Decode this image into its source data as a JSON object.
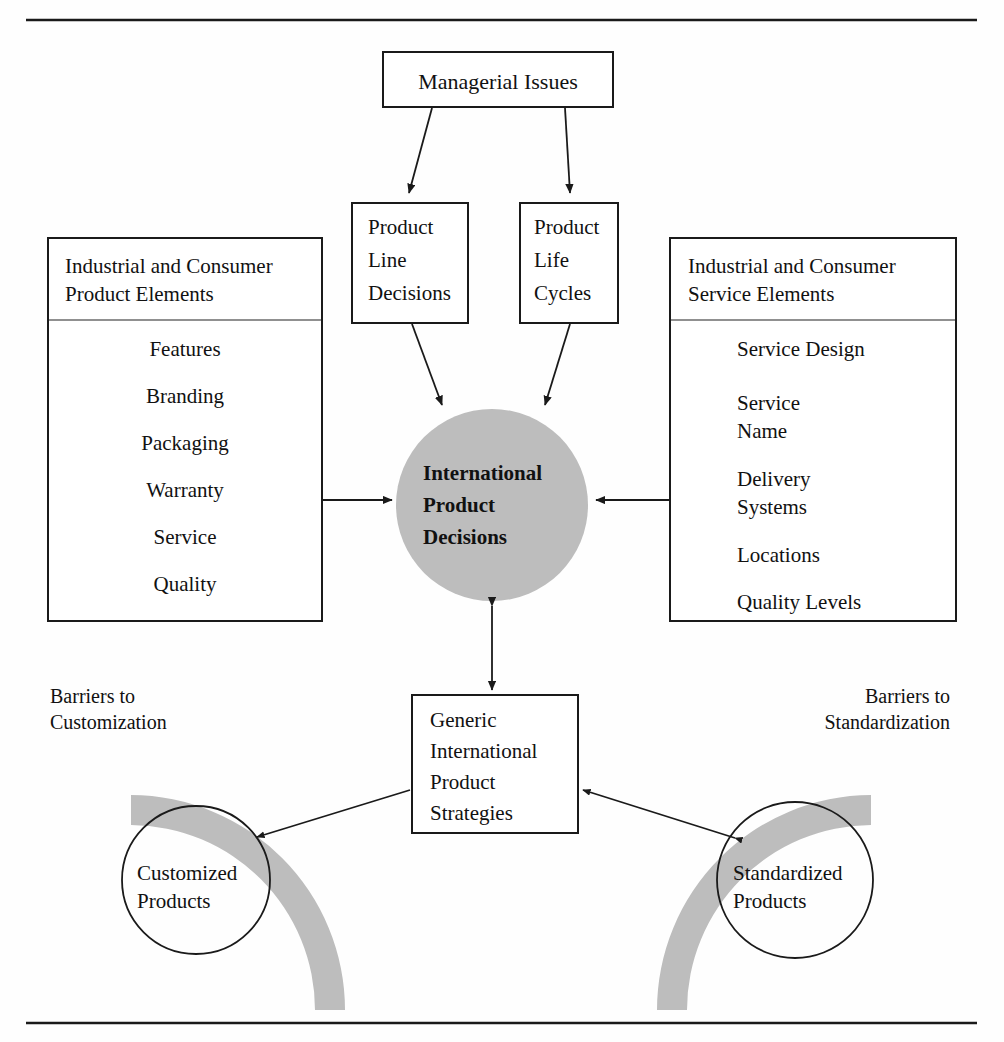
{
  "figure": {
    "type": "flow-diagram",
    "accent_gray": "#bdbdbd",
    "line_color": "#1a1a1a",
    "rules": [
      "top-rule",
      "bottom-rule"
    ]
  },
  "top_box": {
    "label": "Managerial Issues"
  },
  "mid_boxes": [
    {
      "id": "product-line-decisions",
      "lines": [
        "Product",
        "Line",
        "Decisions"
      ]
    },
    {
      "id": "product-life-cycles",
      "lines": [
        "Product",
        "Life",
        "Cycles"
      ]
    }
  ],
  "left_panel": {
    "header": [
      "Industrial and Consumer",
      "Product Elements"
    ],
    "items": [
      "Features",
      "Branding",
      "Packaging",
      "Warranty",
      "Service",
      "Quality"
    ]
  },
  "right_panel": {
    "header": [
      "Industrial and Consumer",
      "Service Elements"
    ],
    "items": [
      "Service Design",
      "Service\nName",
      "Delivery\nSystems",
      "Locations",
      "Quality Levels"
    ]
  },
  "hub": {
    "lines": [
      "International",
      "Product",
      "Decisions"
    ],
    "fill": "#bdbdbd"
  },
  "strategies_box": {
    "lines": [
      "Generic",
      "International",
      "Product",
      "Strategies"
    ]
  },
  "barriers": [
    {
      "id": "barriers-to-customization",
      "lines": [
        "Barriers to",
        "Customization"
      ]
    },
    {
      "id": "barriers-to-standardization",
      "lines": [
        "Barriers to",
        "Standardization"
      ]
    }
  ],
  "outcome_circles": [
    {
      "id": "customized-products",
      "lines": [
        "Customized",
        "Products"
      ]
    },
    {
      "id": "standardized-products",
      "lines": [
        "Standardized",
        "Products"
      ]
    }
  ]
}
